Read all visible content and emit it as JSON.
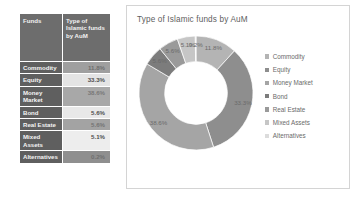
{
  "table": {
    "headers": [
      "Funds",
      "Type of Islamic funds by AuM"
    ],
    "header_col1": "Funds",
    "header_col2": "Type of Islamic funds by AuM",
    "rows": [
      {
        "name": "Commodity",
        "value": "11.8%"
      },
      {
        "name": "Equity",
        "value": "33.3%"
      },
      {
        "name": "Money Market",
        "value": "38.6%"
      },
      {
        "name": "Bond",
        "value": "5.6%"
      },
      {
        "name": "Real Estate",
        "value": "5.6%"
      },
      {
        "name": "Mixed Assets",
        "value": "5.1%"
      },
      {
        "name": "Alternatives",
        "value": "0.2%"
      }
    ]
  },
  "chart": {
    "title": "Type of Islamic funds by AuM",
    "legend_position": "right"
  },
  "chart_data": {
    "type": "pie",
    "title": "Type of Islamic funds by AuM",
    "subtitle": "",
    "xlabel": "",
    "ylabel": "",
    "donut": true,
    "hole_ratio": 0.55,
    "grid": false,
    "legend_position": "right",
    "categories": [
      "Commodity",
      "Equity",
      "Money Market",
      "Bond",
      "Real Estate",
      "Mixed Assets",
      "Alternatives"
    ],
    "values": [
      11.8,
      33.3,
      38.6,
      5.6,
      5.6,
      5.1,
      0.2
    ],
    "data_labels": [
      "11.8%",
      "33.3%",
      "38.6%",
      "5.6%",
      "5.6%",
      "5.1%",
      "0.2%"
    ],
    "colors": [
      "#b4b4b4",
      "#8e8e8e",
      "#a5a5a5",
      "#7c7c7c",
      "#9a9a9a",
      "#c6c6c6",
      "#dcdcdc"
    ]
  },
  "legend": {
    "items": [
      {
        "label": "Commodity",
        "color": "#b4b4b4"
      },
      {
        "label": "Equity",
        "color": "#8e8e8e"
      },
      {
        "label": "Money Market",
        "color": "#a5a5a5"
      },
      {
        "label": "Bond",
        "color": "#7c7c7c"
      },
      {
        "label": "Real Estate",
        "color": "#9a9a9a"
      },
      {
        "label": "Mixed Assets",
        "color": "#c6c6c6"
      },
      {
        "label": "Alternatives",
        "color": "#dcdcdc"
      }
    ]
  }
}
